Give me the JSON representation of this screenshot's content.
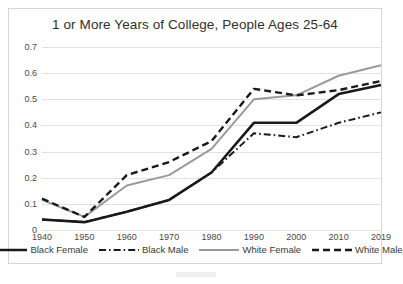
{
  "chart_data": {
    "type": "line",
    "title": "1 or More Years of College, People Ages 25-64",
    "xlabel": "",
    "ylabel": "",
    "categories": [
      "1940",
      "1950",
      "1960",
      "1970",
      "1980",
      "1990",
      "2000",
      "2010",
      "2019"
    ],
    "x": [
      1940,
      1950,
      1960,
      1970,
      1980,
      1990,
      2000,
      2010,
      2019
    ],
    "ylim": [
      0,
      0.7
    ],
    "yticks": [
      0,
      0.1,
      0.2,
      0.3,
      0.4,
      0.5,
      0.6,
      0.7
    ],
    "ytick_labels": [
      "0",
      "0.1",
      "0.2",
      "0.3",
      "0.4",
      "0.5",
      "0.6",
      "0.7"
    ],
    "grid": true,
    "legend_position": "bottom",
    "series": [
      {
        "name": "Black Female",
        "style": "solid",
        "color": "#1a1a1a",
        "width": 2.6,
        "values": [
          0.04,
          0.03,
          0.07,
          0.115,
          0.22,
          0.41,
          0.41,
          0.52,
          0.555
        ]
      },
      {
        "name": "Black Male",
        "style": "dash-dot",
        "color": "#1a1a1a",
        "width": 2.0,
        "values": [
          0.04,
          0.03,
          0.07,
          0.115,
          0.22,
          0.37,
          0.355,
          0.41,
          0.45
        ]
      },
      {
        "name": "White Female",
        "style": "solid",
        "color": "#9a9a9a",
        "width": 2.0,
        "values": [
          0.115,
          0.05,
          0.17,
          0.21,
          0.31,
          0.5,
          0.515,
          0.59,
          0.63
        ]
      },
      {
        "name": "White Male",
        "style": "dashed",
        "color": "#1a1a1a",
        "width": 2.4,
        "values": [
          0.12,
          0.05,
          0.21,
          0.26,
          0.34,
          0.54,
          0.515,
          0.535,
          0.57
        ]
      }
    ]
  }
}
